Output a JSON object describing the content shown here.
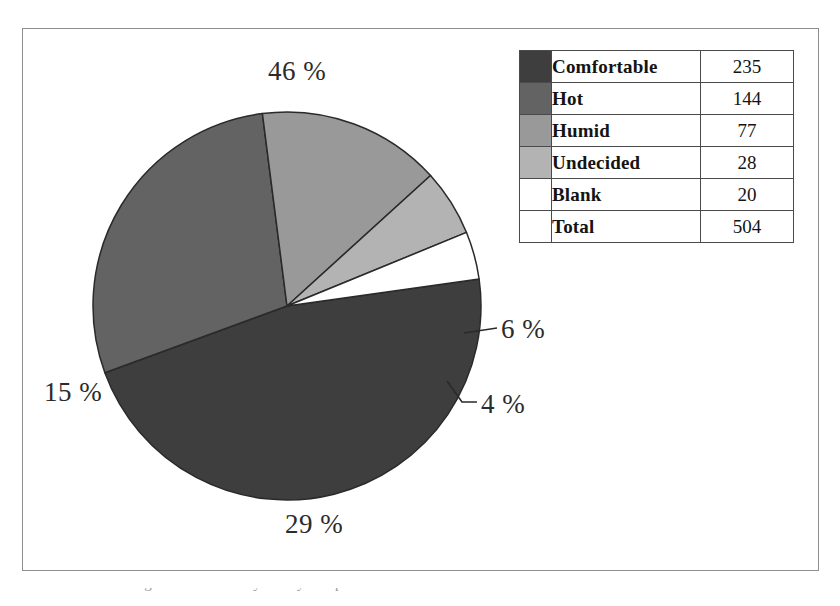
{
  "figure": {
    "caption": "Table 2.1  and  the flight deck laboratory survey: temperature conditions"
  },
  "legend_table": {
    "rows": [
      {
        "label": "Comfortable",
        "value": "235",
        "color": "#3e3e3e"
      },
      {
        "label": "Hot",
        "value": "144",
        "color": "#636363"
      },
      {
        "label": "Humid",
        "value": "77",
        "color": "#999999"
      },
      {
        "label": "Undecided",
        "value": "28",
        "color": "#b3b3b3"
      },
      {
        "label": "Blank",
        "value": "20",
        "color": "#ffffff"
      }
    ],
    "total": {
      "label": "Total",
      "value": "504"
    }
  },
  "labels": {
    "comfortable": "46 %",
    "hot": "29 %",
    "humid": "15 %",
    "undecided": "6 %",
    "blank": "4 %"
  },
  "chart_data": {
    "type": "pie",
    "title": "",
    "categories": [
      "Comfortable",
      "Hot",
      "Humid",
      "Undecided",
      "Blank"
    ],
    "values": [
      235,
      144,
      77,
      28,
      20
    ],
    "percentages": [
      46,
      29,
      15,
      6,
      4
    ],
    "total": 504,
    "colors": [
      "#3e3e3e",
      "#636363",
      "#999999",
      "#b3b3b3",
      "#ffffff"
    ],
    "slice_border_color": "#2a2a2a",
    "legend_position": "right",
    "legend_style": "table",
    "data_labels": [
      "46 %",
      "29 %",
      "15 %",
      "6 %",
      "4 %"
    ],
    "leader_lines": [
      "Undecided",
      "Blank"
    ],
    "start_angle_deg": -8,
    "direction": "clockwise",
    "grid": false
  }
}
